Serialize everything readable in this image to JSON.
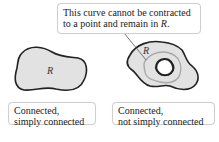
{
  "callout": {
    "line1": "This curve cannot be contracted",
    "line2_prefix": "to a point and remain in ",
    "line2_var": "R",
    "line2_suffix": "."
  },
  "regions": {
    "left": {
      "label": "R"
    },
    "right": {
      "label": "R"
    }
  },
  "captions": {
    "left": {
      "line1": "Connected,",
      "line2": "simply connected"
    },
    "right": {
      "line1": "Connected,",
      "line2": "not simply connected"
    }
  },
  "colors": {
    "region_fill": "#e2e2e2",
    "outline": "#222222",
    "curve": "#a9a9a9",
    "box_border": "#cfcfcf"
  }
}
